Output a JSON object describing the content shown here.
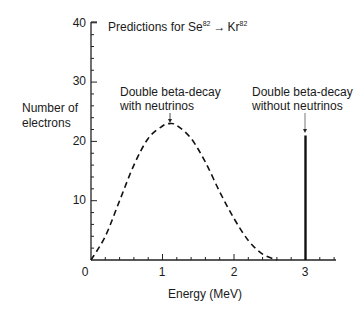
{
  "chart_data": {
    "type": "line",
    "title_parts": {
      "prefix": "Predictions for Se",
      "sup1": "82",
      "arrow": "→",
      "mid": "Kr",
      "sup2": "82"
    },
    "xlabel": "Energy (MeV)",
    "ylabel": [
      "Number of",
      "electrons"
    ],
    "xlim": [
      0,
      3.4
    ],
    "ylim": [
      0,
      40
    ],
    "xticks": [
      "0",
      "1",
      "2",
      "3"
    ],
    "yticks": [
      "10",
      "20",
      "30",
      "40"
    ],
    "grid": false,
    "series": [
      {
        "name": "Double beta-decay with neutrinos",
        "style": "dashed",
        "x": [
          0,
          0.2,
          0.4,
          0.6,
          0.8,
          1.0,
          1.1,
          1.2,
          1.4,
          1.6,
          1.8,
          2.0,
          2.2,
          2.4,
          2.6
        ],
        "y": [
          0,
          4,
          10,
          16,
          20.5,
          22.6,
          23,
          22.7,
          20.5,
          16.5,
          11.5,
          7,
          3.3,
          1,
          0
        ]
      },
      {
        "name": "Double beta-decay without neutrinos",
        "style": "spike",
        "x": [
          3.0
        ],
        "y": [
          21
        ]
      }
    ],
    "annotations": [
      {
        "lines": [
          "Double beta-decay",
          "with neutrinos"
        ],
        "points_to": [
          1.1,
          23
        ]
      },
      {
        "lines": [
          "Double beta-decay",
          "without neutrinos"
        ],
        "points_to": [
          3.0,
          21
        ]
      }
    ]
  }
}
